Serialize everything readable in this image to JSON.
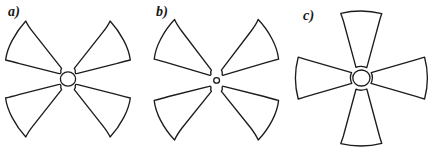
{
  "figure": {
    "background_color": "#ffffff",
    "stroke_color": "#1c1c1c",
    "fill_color": "#ffffff",
    "width": 434,
    "height": 155,
    "caption_style": "italic-serif"
  },
  "panels": [
    {
      "id": "a",
      "label": "a)",
      "petal_count": 4,
      "arrangement": "X (diagonal) orientation, four sectors with a visible round central hub",
      "hub_radius": 8,
      "petal_outer_radius": 60,
      "petal_inner_radius": 9,
      "petal_angular_width_deg": 52,
      "petal_center_angles_deg": [
        42,
        138,
        222,
        318
      ],
      "center": {
        "x": 68,
        "y": 79
      }
    },
    {
      "id": "b",
      "label": "b)",
      "petal_count": 4,
      "arrangement": "X (diagonal) orientation, four sectors converging to a very small central hub",
      "hub_radius": 3,
      "petal_outer_radius": 60,
      "petal_inner_radius": 5,
      "petal_angular_width_deg": 56,
      "petal_center_angles_deg": [
        45,
        135,
        225,
        315
      ],
      "center": {
        "x": 70,
        "y": 80
      }
    },
    {
      "id": "c",
      "label": "c)",
      "petal_count": 4,
      "arrangement": "Plus / cross orientation, four sectors at up, down, left and right with a round central hub",
      "hub_radius": 9,
      "petal_outer_radius": 62,
      "petal_inner_radius": 10,
      "petal_angular_width_deg": 46,
      "petal_side_angular_width_deg": 56,
      "petal_center_angles_deg": [
        90,
        180,
        270,
        0
      ],
      "center": {
        "x": 73,
        "y": 78
      }
    }
  ]
}
